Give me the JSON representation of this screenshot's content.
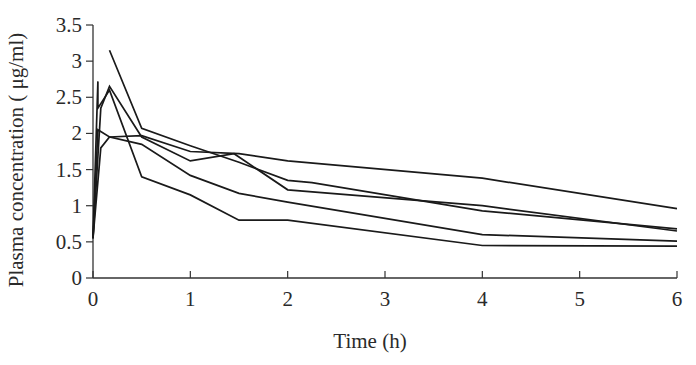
{
  "chart_data": {
    "type": "line",
    "title": "",
    "xlabel": "Time (h)",
    "ylabel": "Plasma concentration ( μg/ml)",
    "xlim": [
      0,
      6
    ],
    "ylim": [
      0,
      3.5
    ],
    "x_ticks": [
      "0",
      "1",
      "2",
      "3",
      "4",
      "5",
      "6"
    ],
    "y_ticks": [
      "0",
      "0.5",
      "1",
      "1.5",
      "2",
      "2.5",
      "3",
      "3.5"
    ],
    "grid": false,
    "legend": "none",
    "line_color": "#1a1a1a",
    "series": [
      {
        "name": "Subject 1",
        "points": [
          [
            0,
            0.55
          ],
          [
            0.05,
            2.72
          ],
          [
            0.05,
            2.35
          ],
          [
            0.17,
            2.6
          ],
          [
            0.5,
            1.4
          ],
          [
            1,
            1.15
          ],
          [
            1.5,
            0.8
          ],
          [
            2,
            0.8
          ],
          [
            4,
            0.45
          ],
          [
            6,
            0.44
          ]
        ]
      },
      {
        "name": "Subject 2",
        "points": [
          [
            0,
            0.55
          ],
          [
            0.08,
            2.35
          ],
          [
            0.17,
            2.65
          ],
          [
            0.5,
            1.95
          ],
          [
            1,
            1.62
          ],
          [
            1.45,
            1.72
          ],
          [
            2,
            1.22
          ],
          [
            4,
            1.0
          ],
          [
            6,
            0.65
          ]
        ]
      },
      {
        "name": "Subject 3",
        "points": [
          [
            0,
            0.55
          ],
          [
            0.05,
            2.05
          ],
          [
            0.17,
            1.95
          ],
          [
            0.5,
            1.97
          ],
          [
            1,
            1.75
          ],
          [
            1.5,
            1.72
          ],
          [
            2,
            1.62
          ],
          [
            4,
            1.38
          ],
          [
            6,
            0.96
          ]
        ]
      },
      {
        "name": "Subject 4",
        "points": [
          [
            0,
            0.55
          ],
          [
            0.08,
            1.8
          ],
          [
            0.17,
            1.95
          ],
          [
            0.5,
            1.85
          ],
          [
            1,
            1.42
          ],
          [
            1.5,
            1.17
          ],
          [
            2,
            1.05
          ],
          [
            4,
            0.6
          ],
          [
            6,
            0.51
          ]
        ]
      },
      {
        "name": "Subject 5",
        "points": [
          [
            0.17,
            3.15
          ],
          [
            0.5,
            2.07
          ],
          [
            1,
            1.83
          ],
          [
            1.5,
            1.6
          ],
          [
            2,
            1.35
          ],
          [
            2.25,
            1.32
          ],
          [
            4,
            0.93
          ],
          [
            6,
            0.68
          ]
        ]
      }
    ]
  }
}
